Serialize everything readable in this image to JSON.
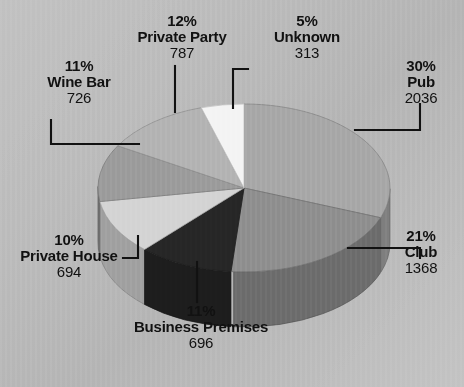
{
  "chart_data": {
    "type": "pie",
    "title": "",
    "subtitle": "",
    "xlabel": "",
    "ylabel": "",
    "legend_position": "none",
    "grid": false,
    "three_d": true,
    "total": 6620,
    "categories": [
      "Pub",
      "Club",
      "Business Premises",
      "Private House",
      "Wine Bar",
      "Private Party",
      "Unknown"
    ],
    "values": [
      2036,
      1368,
      696,
      694,
      726,
      787,
      313
    ],
    "percents": [
      30,
      21,
      11,
      10,
      11,
      12,
      5
    ],
    "colors": [
      "#a8a8a8",
      "#8f8f8f",
      "#262626",
      "#d4d4d4",
      "#9c9c9c",
      "#b4b4b4",
      "#f4f4f4"
    ],
    "slices": [
      {
        "name": "Pub",
        "percent_label": "30%",
        "value_label": "2036",
        "value": 2036,
        "percent": 30,
        "color": "#a8a8a8"
      },
      {
        "name": "Club",
        "percent_label": "21%",
        "value_label": "1368",
        "value": 1368,
        "percent": 21,
        "color": "#8f8f8f"
      },
      {
        "name": "Business Premises",
        "percent_label": "11%",
        "value_label": "696",
        "value": 696,
        "percent": 11,
        "color": "#262626"
      },
      {
        "name": "Private House",
        "percent_label": "10%",
        "value_label": "694",
        "value": 694,
        "percent": 10,
        "color": "#d4d4d4"
      },
      {
        "name": "Wine Bar",
        "percent_label": "11%",
        "value_label": "726",
        "value": 726,
        "percent": 11,
        "color": "#9c9c9c"
      },
      {
        "name": "Private Party",
        "percent_label": "12%",
        "value_label": "787",
        "value": 787,
        "percent": 12,
        "color": "#b4b4b4"
      },
      {
        "name": "Unknown",
        "percent_label": "5%",
        "value_label": "313",
        "value": 313,
        "percent": 5,
        "color": "#f4f4f4"
      }
    ],
    "background_color": "#bdbdbd",
    "leader_line_color": "#111111"
  },
  "labels": {
    "unknown": {
      "pct": "5%",
      "name": "Unknown",
      "val": "313"
    },
    "pub": {
      "pct": "30%",
      "name": "Pub",
      "val": "2036"
    },
    "club": {
      "pct": "21%",
      "name": "Club",
      "val": "1368"
    },
    "business": {
      "pct": "11%",
      "name": "Business Premises",
      "val": "696"
    },
    "private_house": {
      "pct": "10%",
      "name": "Private House",
      "val": "694"
    },
    "wine_bar": {
      "pct": "11%",
      "name": "Wine Bar",
      "val": "726"
    },
    "private_party": {
      "pct": "12%",
      "name": "Private Party",
      "val": "787"
    }
  }
}
